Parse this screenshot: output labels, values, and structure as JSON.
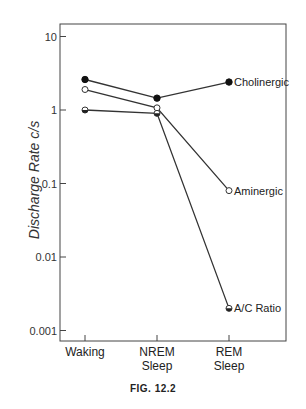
{
  "chart_data": {
    "type": "line",
    "title": "",
    "caption": "FIG. 12.2",
    "xlabel": "",
    "ylabel": "Discharge Rate c/s",
    "yscale": "log",
    "ylim": [
      0.001,
      10
    ],
    "yticks": [
      10,
      1,
      0.1,
      0.01,
      0.001
    ],
    "ytick_labels": [
      "10",
      "1",
      "0.1",
      "0.01",
      "0.001"
    ],
    "categories": [
      "Waking",
      "NREM Sleep",
      "REM Sleep"
    ],
    "category_lines": [
      [
        "Waking"
      ],
      [
        "NREM",
        "Sleep"
      ],
      [
        "REM",
        "Sleep"
      ]
    ],
    "grid": false,
    "legend": "inline labels at right end of each line",
    "series": [
      {
        "name": "Cholinergic",
        "marker": "filled-circle",
        "values": [
          2.6,
          1.45,
          2.4
        ]
      },
      {
        "name": "Aminergic",
        "marker": "open-circle",
        "values": [
          1.9,
          1.07,
          0.08
        ]
      },
      {
        "name": "A/C Ratio",
        "marker": "half-filled-circle",
        "values": [
          1.0,
          0.9,
          0.002
        ]
      }
    ]
  }
}
